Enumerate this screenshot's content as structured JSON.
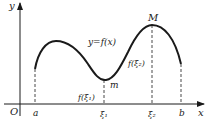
{
  "figure": {
    "axes": {
      "x_label": "x",
      "y_label": "y",
      "origin_label": "O"
    },
    "curve_label": "y=f(x)",
    "points": {
      "max_label": "M",
      "min_label": "m"
    },
    "x_ticks": [
      "a",
      "ξ₁",
      "ξ₂",
      "b"
    ],
    "value_labels": {
      "f_xi1": "f(ξ₁)",
      "f_xi2": "f(ξ₂)"
    },
    "colors": {
      "line": "#1a1a1a",
      "background": "#ffffff"
    }
  }
}
